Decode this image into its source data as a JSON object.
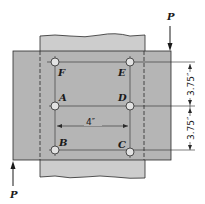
{
  "figure": {
    "type": "bolted lap joint diagram",
    "colors": {
      "upper_plate": "#c9c9c9",
      "lower_plate": "#b3b3b3",
      "line": "#2a2a2a",
      "background": "#ffffff"
    },
    "loads": {
      "top": {
        "label": "P",
        "direction": "down"
      },
      "bottom": {
        "label": "P",
        "direction": "up"
      }
    },
    "bolts": [
      {
        "id": "F",
        "label": "F"
      },
      {
        "id": "E",
        "label": "E"
      },
      {
        "id": "A",
        "label": "A"
      },
      {
        "id": "D",
        "label": "D"
      },
      {
        "id": "B",
        "label": "B"
      },
      {
        "id": "C",
        "label": "C"
      }
    ],
    "dimensions": {
      "horizontal_spacing": "4″",
      "vertical_spacing_upper": "3.75″",
      "vertical_spacing_lower": "3.75″"
    }
  }
}
